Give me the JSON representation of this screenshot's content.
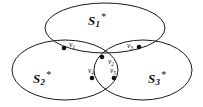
{
  "figure": {
    "background_color": "#ffffff",
    "stroke_color": "#1a1a1a",
    "dot_color": "#111111",
    "width": 203,
    "height": 107
  },
  "sets": [
    {
      "id": "S1",
      "name": "S_1^*",
      "base": "S",
      "subscript": "1",
      "superscript": "*",
      "label_x": 88,
      "label_y": 12,
      "cx": 105,
      "cy": 28,
      "rx": 60,
      "ry": 25
    },
    {
      "id": "S2",
      "name": "S_2^*",
      "base": "S",
      "subscript": "2",
      "superscript": "*",
      "label_x": 33,
      "label_y": 70,
      "cx": 65,
      "cy": 70,
      "rx": 53,
      "ry": 30
    },
    {
      "id": "S3",
      "name": "S_3^*",
      "base": "S",
      "subscript": "3",
      "superscript": "*",
      "label_x": 148,
      "label_y": 70,
      "cx": 143,
      "cy": 70,
      "rx": 49,
      "ry": 30
    }
  ],
  "vertices": [
    {
      "id": "v1",
      "base": "v",
      "subscript": "1",
      "dot_x": 64,
      "dot_y": 48,
      "label_x": 69,
      "label_y": 41,
      "region": "S1-S2"
    },
    {
      "id": "v2",
      "base": "v",
      "subscript": "2",
      "dot_x": 102,
      "dot_y": 57,
      "label_x": 108,
      "label_y": 58,
      "region": "S1-S2-S3"
    },
    {
      "id": "v3",
      "base": "v",
      "subscript": "3",
      "dot_x": 139,
      "dot_y": 47,
      "label_x": 127,
      "label_y": 42,
      "region": "S1-S3"
    },
    {
      "id": "v4",
      "base": "v",
      "subscript": "4",
      "dot_x": 92,
      "dot_y": 78,
      "label_x": 88,
      "label_y": 67,
      "region": "S1-S2-S3"
    },
    {
      "id": "v5",
      "base": "v",
      "subscript": "5",
      "dot_x": 114,
      "dot_y": 78,
      "label_x": 110,
      "label_y": 67,
      "region": "S1-S2-S3"
    }
  ]
}
